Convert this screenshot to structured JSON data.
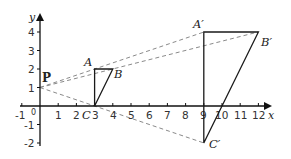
{
  "diagram": {
    "type": "coordinate-plane-enlargement",
    "axes": {
      "x_label": "x",
      "y_label": "y",
      "x_ticks": [
        "-1",
        "0",
        "1",
        "2",
        "3",
        "4",
        "5",
        "6",
        "7",
        "8",
        "9",
        "10",
        "11",
        "12"
      ],
      "y_ticks": [
        "4",
        "3",
        "2",
        "1",
        "-1",
        "-2"
      ],
      "x_range": [
        -1,
        12
      ],
      "y_range": [
        -2,
        4
      ]
    },
    "center": {
      "label": "P",
      "x": 0,
      "y": 1
    },
    "original_triangle": {
      "A": {
        "label": "A",
        "x": 3,
        "y": 2
      },
      "B": {
        "label": "B",
        "x": 4,
        "y": 2
      },
      "C": {
        "label": "C",
        "x": 3,
        "y": 0
      }
    },
    "image_triangle": {
      "A_prime": {
        "label": "A′",
        "x": 9,
        "y": 4
      },
      "B_prime": {
        "label": "B′",
        "x": 12,
        "y": 4
      },
      "C_prime": {
        "label": "C′",
        "x": 9,
        "y": -2
      }
    },
    "colors": {
      "axis": "#111111",
      "triangle": "#1a1a1a",
      "dashed_rays": "#8a8a8a"
    }
  }
}
